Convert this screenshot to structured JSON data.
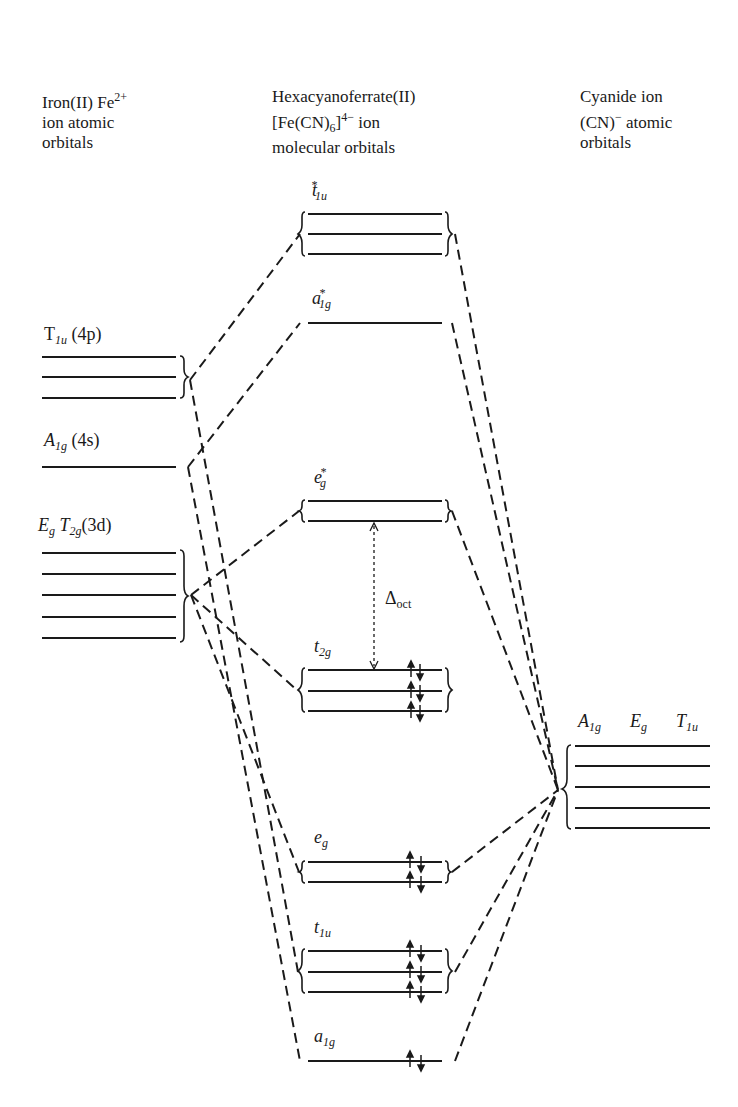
{
  "headers": {
    "left": {
      "line1": "Iron(II) Fe",
      "line1_sup": "2+",
      "line2": "ion atomic",
      "line3": "orbitals"
    },
    "middle": {
      "line1": "Hexacyanoferrate(II)",
      "line2_pre": "[Fe(CN)",
      "line2_sub": "6",
      "line2_mid": "]",
      "line2_sup": "4−",
      "line2_post": " ion",
      "line3": "molecular orbitals"
    },
    "right": {
      "line1": "Cyanide ion",
      "line2_pre": "(CN)",
      "line2_sup": "−",
      "line2_post": " atomic",
      "line3": "orbitals"
    }
  },
  "fe_orbitals": [
    {
      "id": "T1u",
      "main": "T",
      "sub": "1u",
      "paren": "(4p)",
      "paren_italic": "p",
      "level_count": 3
    },
    {
      "id": "A1g",
      "main": "A",
      "sub": "1g",
      "paren": "(4s)",
      "level_count": 1
    },
    {
      "id": "EgT2g",
      "main1": "E",
      "sub1": "g",
      "main2": "T",
      "sub2": "2g",
      "paren": "(3d)",
      "level_count": 5
    }
  ],
  "mo_levels": [
    {
      "id": "t1u_star",
      "main": "t",
      "sub": "1u",
      "sup": "*",
      "level_count": 3,
      "electrons": 0
    },
    {
      "id": "a1g_star",
      "main": "a",
      "sub": "1g",
      "sup": "*",
      "level_count": 1,
      "electrons": 0
    },
    {
      "id": "eg_star",
      "main": "e",
      "sub": "g",
      "sup": "*",
      "level_count": 2,
      "electrons": 0
    },
    {
      "id": "t2g",
      "main": "t",
      "sub": "2g",
      "level_count": 3,
      "electrons": 6
    },
    {
      "id": "eg",
      "main": "e",
      "sub": "g",
      "level_count": 2,
      "electrons": 4
    },
    {
      "id": "t1u",
      "main": "t",
      "sub": "1u",
      "level_count": 3,
      "electrons": 6
    },
    {
      "id": "a1g",
      "main": "a",
      "sub": "1g",
      "level_count": 1,
      "electrons": 2
    }
  ],
  "cn_orbitals": {
    "labels": [
      {
        "main": "A",
        "sub": "1g"
      },
      {
        "main": "E",
        "sub": "g"
      },
      {
        "main": "T",
        "sub": "1u"
      }
    ],
    "level_count": 5
  },
  "delta": {
    "symbol": "Δ",
    "sub": "oct"
  },
  "colors": {
    "line": "#1a1a1a",
    "background": "#ffffff"
  }
}
